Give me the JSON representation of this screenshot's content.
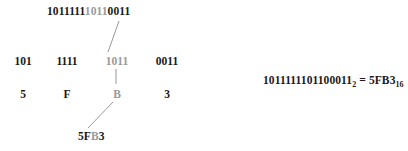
{
  "figure": {
    "highlight_color": "#9a9a9a",
    "text_color": "#1a1a1a",
    "line_color": "#8c8c8c"
  },
  "binary_full": {
    "prefix": "1011111",
    "highlighted": "1011",
    "suffix": "0011",
    "full": "1011111101100011"
  },
  "groups": [
    {
      "bits": "101",
      "highlighted": false
    },
    {
      "bits": "1111",
      "highlighted": false
    },
    {
      "bits": "1011",
      "highlighted": true
    },
    {
      "bits": "0011",
      "highlighted": false
    }
  ],
  "digits": [
    {
      "hex": "5",
      "highlighted": false
    },
    {
      "hex": "F",
      "highlighted": false
    },
    {
      "hex": "B",
      "highlighted": true
    },
    {
      "hex": "3",
      "highlighted": false
    }
  ],
  "result": {
    "prefix": "5F",
    "highlighted": "B",
    "suffix": "3",
    "full": "5FB3"
  },
  "equation": {
    "binary_value": "1011111101100011",
    "binary_base": "2",
    "operator": " = ",
    "hex_value": "5FB3",
    "hex_base": "16",
    "full": "1011111101100011₂ = 5FB3₁₆"
  }
}
